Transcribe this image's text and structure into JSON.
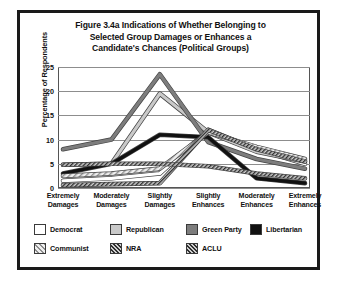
{
  "figure": {
    "title_lines": [
      "Figure 3.4a Indications of Whether Belonging to",
      "Selected Group Damages or Enhances a",
      "Candidate's Chances (Political Groups)"
    ]
  },
  "chart_data": {
    "type": "line",
    "title": "Figure 3.4a Indications of Whether Belonging to Selected Group Damages or Enhances a Candidate's Chances (Political Groups)",
    "xlabel": "",
    "ylabel": "Percentage of Respondents",
    "ylim": [
      0,
      25
    ],
    "yticks": [
      0,
      5,
      10,
      15,
      20,
      25
    ],
    "ytick_labels": [
      "0",
      "5",
      "10",
      "15",
      "20",
      "25"
    ],
    "grid": true,
    "legend_position": "bottom",
    "categories": [
      "Extremely Damages",
      "Moderately Damages",
      "Slightly Damages",
      "Slightly Enhances",
      "Moderately Enhances",
      "Extremely Enhances"
    ],
    "category_lines": [
      [
        "Extremely",
        "Damages"
      ],
      [
        "Moderately",
        "Damages"
      ],
      [
        "Slightly",
        "Damages"
      ],
      [
        "Slightly",
        "Enhances"
      ],
      [
        "Moderately",
        "Enhances"
      ],
      [
        "Extremely",
        "Enhances"
      ]
    ],
    "series": [
      {
        "name": "Democrat",
        "color": "#ffffff",
        "pattern": "solid",
        "stroke": "#9a9a9a",
        "values": [
          1.5,
          2.0,
          3.0,
          12.0,
          8.0,
          5.0
        ]
      },
      {
        "name": "Republican",
        "color": "#c9c9c9",
        "pattern": "solid",
        "stroke": "#b4b4b4",
        "values": [
          4.8,
          5.0,
          19.5,
          11.5,
          7.5,
          5.5
        ]
      },
      {
        "name": "Green Party",
        "color": "#7d7d7d",
        "pattern": "solid",
        "stroke": "#7d7d7d",
        "values": [
          8.0,
          10.0,
          23.5,
          9.5,
          6.0,
          4.0
        ]
      },
      {
        "name": "Libertarian",
        "color": "#111111",
        "pattern": "solid",
        "stroke": "#111111",
        "values": [
          3.0,
          5.0,
          11.0,
          10.5,
          2.0,
          1.0
        ]
      },
      {
        "name": "Communist",
        "color": "#d9d9d9",
        "pattern": "hatch-light",
        "stroke": "#cfcfcf",
        "values": [
          2.5,
          3.0,
          4.0,
          11.5,
          8.5,
          6.0
        ]
      },
      {
        "name": "NRA",
        "color": "#6e6e6e",
        "pattern": "hatch-dark",
        "stroke": "#8a8a8a",
        "values": [
          0.6,
          0.8,
          1.0,
          12.0,
          8.0,
          5.5
        ]
      },
      {
        "name": "ACLU",
        "color": "#5a5a5a",
        "pattern": "hatch-dark",
        "stroke": "#6a6a6a",
        "values": [
          4.8,
          5.0,
          5.0,
          4.5,
          3.0,
          2.0
        ]
      }
    ]
  }
}
